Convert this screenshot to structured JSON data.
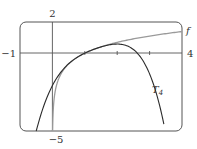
{
  "chart_data": {
    "type": "line",
    "title": "",
    "xlabel": "",
    "ylabel": "",
    "xlim": [
      -1,
      4
    ],
    "ylim": [
      -5,
      2
    ],
    "grid": false,
    "x_ticks": [
      1,
      2,
      3
    ],
    "tick_labels": {
      "x_min": "−1",
      "x_max": "4",
      "y_max": "2",
      "y_min": "−5"
    },
    "series": [
      {
        "name": "f",
        "label": "f",
        "expression": "ln(x)",
        "color": "#9a9a9a",
        "x": [
          0.007,
          0.05,
          0.1,
          0.25,
          0.5,
          1,
          1.5,
          2,
          2.5,
          3,
          3.5,
          4
        ],
        "values": [
          -4.96,
          -3.0,
          -2.3,
          -1.39,
          -0.69,
          0.0,
          0.41,
          0.69,
          0.92,
          1.1,
          1.25,
          1.39
        ]
      },
      {
        "name": "T4",
        "label": "T",
        "label_subscript": "4",
        "expression": "(x-1) - (x-1)^2/2 + (x-1)^3/3 - (x-1)^4/4",
        "color": "#333333",
        "x": [
          -0.5,
          0,
          0.5,
          1,
          1.5,
          2,
          2.5,
          3,
          3.45
        ],
        "values": [
          -5.0,
          -2.08,
          -0.68,
          0.0,
          0.4,
          0.58,
          0.42,
          -0.67,
          -4.66
        ]
      }
    ]
  }
}
